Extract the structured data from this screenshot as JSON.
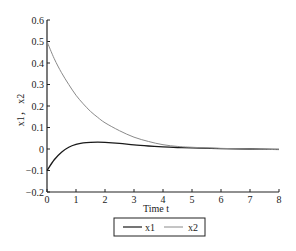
{
  "chart_data": {
    "type": "line",
    "title": "",
    "xlabel": "Time t",
    "ylabel": "x1， x2",
    "xlim": [
      0,
      8
    ],
    "ylim": [
      -0.2,
      0.6
    ],
    "xticks": [
      "0",
      "1",
      "2",
      "3",
      "4",
      "5",
      "6",
      "7",
      "8"
    ],
    "yticks": [
      "0.6",
      "0.5",
      "0.4",
      "0.3",
      "0.2",
      "0.1",
      "0",
      "−0.1",
      "−0.2"
    ],
    "grid": false,
    "legend_position": "below",
    "x": [
      0,
      0.25,
      0.5,
      0.75,
      1,
      1.25,
      1.5,
      1.75,
      2,
      2.5,
      3,
      3.5,
      4,
      4.5,
      5,
      6,
      7,
      8
    ],
    "series": [
      {
        "name": "x1",
        "color": "#1a1a1a",
        "values": [
          -0.1,
          -0.05,
          -0.015,
          0.008,
          0.021,
          0.028,
          0.031,
          0.032,
          0.031,
          0.026,
          0.019,
          0.014,
          0.01,
          0.007,
          0.005,
          0.002,
          0.0,
          -0.002
        ]
      },
      {
        "name": "x2",
        "color": "#8a8a8a",
        "values": [
          0.5,
          0.42,
          0.355,
          0.3,
          0.25,
          0.21,
          0.175,
          0.147,
          0.122,
          0.085,
          0.055,
          0.035,
          0.02,
          0.012,
          0.008,
          0.003,
          0.0,
          -0.003
        ]
      }
    ]
  },
  "legend": {
    "items": [
      {
        "label": "x1"
      },
      {
        "label": "x2"
      }
    ]
  }
}
